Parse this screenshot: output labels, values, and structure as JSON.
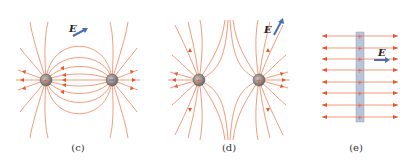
{
  "figure": {
    "panels": [
      {
        "id": "c",
        "caption": "(c)",
        "description": "Electric field lines of an electric dipole: positive charge (left) and negative charge (right)",
        "charges": [
          "+",
          "−"
        ],
        "field_label": "E"
      },
      {
        "id": "d",
        "caption": "(d)",
        "description": "Electric field lines of two equal positive charges",
        "charges": [
          "+",
          "+"
        ],
        "field_label": "E"
      },
      {
        "id": "e",
        "caption": "(e)",
        "description": "Uniform electric field lines on both sides of a positively charged sheet",
        "charges": [
          "+",
          "+",
          "+",
          "+",
          "+",
          "+",
          "+",
          "+"
        ],
        "field_label": "E"
      }
    ],
    "colors": {
      "field_line": "#f0825a",
      "arrow": "#e8542a",
      "charge_fill": "#8a8580",
      "vector": "#4a6fb5",
      "sheet": "#b8c4d8"
    }
  }
}
